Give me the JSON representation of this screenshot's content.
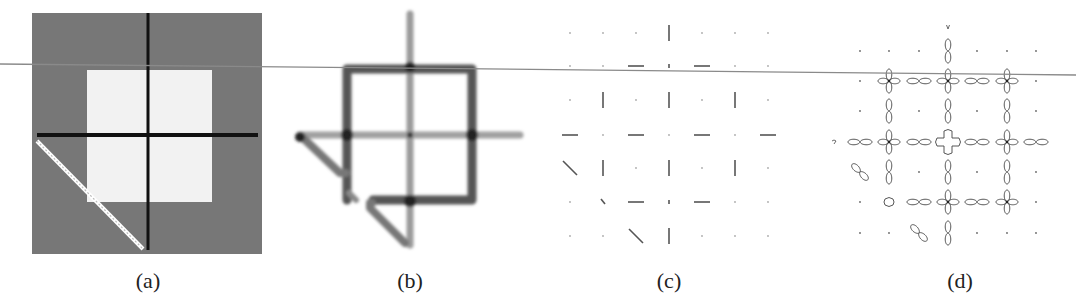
{
  "figure": {
    "panels": [
      {
        "id": "a",
        "caption": "(a)",
        "center_x": 148,
        "description": "Input image: gray background, light square, black cross lines, white diagonal line"
      },
      {
        "id": "b",
        "caption": "(b)",
        "center_x": 410,
        "description": "Blurred edge / line response map"
      },
      {
        "id": "c",
        "caption": "(c)",
        "center_x": 669,
        "description": "7x7 grid of oriented line segments"
      },
      {
        "id": "d",
        "caption": "(d)",
        "center_x": 960,
        "description": "7x7 grid of polar orientation-distribution glyphs"
      }
    ],
    "colors": {
      "background": "#ffffff",
      "panel_a_gray": "#777777",
      "panel_a_light": "#f2f2f2",
      "line_dark": "#111111",
      "stroke_gray": "#555555",
      "overlay_line": "#8a8a8a"
    },
    "overlay_line": {
      "x1": 0,
      "y1": 64,
      "x2": 1076,
      "y2": 75
    }
  },
  "panel_c": {
    "cols": [
      570,
      603,
      636,
      669,
      702,
      735,
      768
    ],
    "rows": [
      33,
      66,
      100,
      135,
      168,
      202,
      236
    ],
    "cells": [
      [
        "dot",
        "dot",
        "dot",
        "v",
        "dot",
        "dot",
        "dot"
      ],
      [
        "dot",
        "dot",
        "h",
        "vs",
        "h",
        "dot",
        "dot"
      ],
      [
        "dot",
        "v",
        "dot",
        "v",
        "dot",
        "v",
        "dot"
      ],
      [
        "h",
        "dot",
        "h",
        "dot",
        "h",
        "dot",
        "h"
      ],
      [
        "d",
        "v",
        "dot",
        "v",
        "dot",
        "v",
        "dot"
      ],
      [
        "dot",
        "ds",
        "h",
        "vs",
        "h",
        "dot",
        "dot"
      ],
      [
        "dot",
        "dot",
        "d",
        "v",
        "dot",
        "dot",
        "dot"
      ]
    ]
  },
  "panel_d": {
    "cols": [
      860,
      889,
      919,
      948,
      977,
      1007,
      1036
    ],
    "rows": [
      51,
      81,
      111,
      142,
      172,
      202,
      233
    ],
    "cells": [
      [
        "dot",
        "dot",
        "dot",
        "v",
        "dot",
        "dot",
        "dot"
      ],
      [
        "dot",
        "cross",
        "h",
        "cross",
        "h",
        "cross",
        "dot"
      ],
      [
        "dot",
        "v",
        "dot",
        "v",
        "dot",
        "v",
        "dot"
      ],
      [
        "h",
        "cross",
        "h",
        "plus",
        "h",
        "cross",
        "h"
      ],
      [
        "d",
        "v",
        "dot",
        "v",
        "dot",
        "v",
        "dot"
      ],
      [
        "dot",
        "blob",
        "h",
        "cross",
        "h",
        "cross",
        "dot"
      ],
      [
        "dot",
        "dot",
        "d",
        "v",
        "dot",
        "dot",
        "dot"
      ]
    ],
    "extra_glyphs": [
      {
        "x": 948,
        "y": 27,
        "type": "tiny-v"
      },
      {
        "x": 834,
        "y": 142,
        "type": "tiny-q"
      }
    ]
  }
}
